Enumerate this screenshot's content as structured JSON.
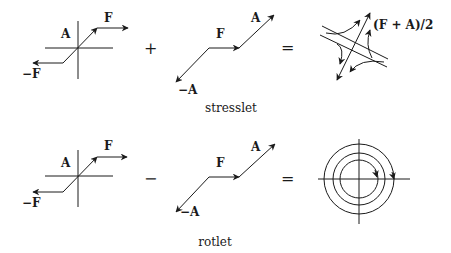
{
  "diagram": {
    "rows": [
      {
        "name": "stresslet",
        "operator": "+",
        "equals": "=",
        "caption": "stresslet",
        "left_labels": {
          "a": "A",
          "f": "F",
          "neg_f": "−F"
        },
        "mid_labels": {
          "f": "F",
          "a": "A",
          "neg_a": "−A"
        },
        "result_label": "(F + A)/2",
        "result_type": "hyperbolic-flow"
      },
      {
        "name": "rotlet",
        "operator": "−",
        "equals": "=",
        "caption": "rotlet",
        "left_labels": {
          "a": "A",
          "f": "F",
          "neg_f": "−F"
        },
        "mid_labels": {
          "f": "F",
          "a": "A",
          "neg_a": "−A"
        },
        "result_label": "",
        "result_type": "concentric-circles"
      }
    ],
    "colors": {
      "stroke": "#1a1a1a",
      "background": "#ffffff"
    }
  }
}
